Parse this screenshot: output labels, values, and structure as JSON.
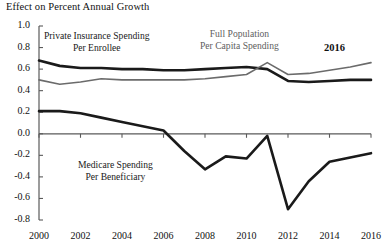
{
  "chart_data": {
    "type": "line",
    "title": "Effect on Percent Annual Growth",
    "xlabel": "",
    "ylabel": "",
    "xlim": [
      2000,
      2016
    ],
    "ylim": [
      -0.8,
      1.0
    ],
    "grid": false,
    "legend_position": "inline-annotations",
    "x": [
      2000,
      2001,
      2002,
      2003,
      2004,
      2005,
      2006,
      2007,
      2008,
      2009,
      2010,
      2011,
      2012,
      2013,
      2014,
      2015,
      2016
    ],
    "xticks": [
      "2000",
      "2002",
      "2004",
      "2006",
      "2008",
      "2010",
      "2012",
      "2014",
      "2016"
    ],
    "yticks": [
      "1.0",
      "0.8",
      "0.6",
      "0.4",
      "0.2",
      "0.0",
      "-0.2",
      "-0.4",
      "-0.6",
      "-0.8"
    ],
    "series": [
      {
        "name": "Private Insurance Spending Per Enrollee",
        "color": "#1a1a1a",
        "width": 2.6,
        "values": [
          0.68,
          0.63,
          0.61,
          0.61,
          0.6,
          0.6,
          0.59,
          0.59,
          0.6,
          0.61,
          0.62,
          0.6,
          0.49,
          0.48,
          0.49,
          0.5,
          0.5
        ]
      },
      {
        "name": "Full Population Per Capita Spending",
        "color": "#6b6b6b",
        "width": 1.6,
        "values": [
          0.5,
          0.46,
          0.48,
          0.51,
          0.5,
          0.5,
          0.5,
          0.5,
          0.51,
          0.53,
          0.55,
          0.66,
          0.55,
          0.56,
          0.59,
          0.62,
          0.66
        ]
      },
      {
        "name": "Medicare Spending Per Beneficiary",
        "color": "#1a1a1a",
        "width": 2.6,
        "values": [
          0.21,
          0.21,
          0.19,
          0.15,
          0.11,
          0.07,
          0.03,
          -0.16,
          -0.33,
          -0.21,
          -0.23,
          -0.02,
          -0.7,
          -0.44,
          -0.26,
          -0.22,
          -0.18
        ]
      }
    ],
    "annotations": [
      {
        "text_line1": "Private Insurance Spending",
        "text_line2": "Per Enrollee",
        "color": "#1a1a1a"
      },
      {
        "text_line1": "Full Population",
        "text_line2": "Per Capita Spending",
        "color": "#5e5e5e"
      },
      {
        "text_line1": "Medicare Spending",
        "text_line2": "Per Beneficiary",
        "color": "#1a1a1a"
      },
      {
        "text_line1": "2016",
        "text_line2": "",
        "color": "#111111"
      }
    ]
  }
}
